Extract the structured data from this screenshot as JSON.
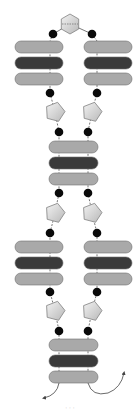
{
  "diagram": {
    "type": "schematic",
    "colors": {
      "light_bar": "#a9a9a9",
      "dark_bar": "#3a3a3a",
      "bar_stroke": "#6e6e6e",
      "bead": "#0a0a0a",
      "connector_fill": "#d4d4d4",
      "connector_stroke": "#808080",
      "chain": "#555555",
      "arrow": "#444444"
    },
    "top_connector": {
      "shape": "hexagon",
      "cx": 70,
      "cy": 24
    },
    "stacks": [
      {
        "id": "upper-left",
        "x": 15,
        "w": 48,
        "rows_y": [
          41,
          57,
          73
        ]
      },
      {
        "id": "upper-right",
        "x": 84,
        "w": 48,
        "rows_y": [
          41,
          57,
          73
        ]
      },
      {
        "id": "middle",
        "x": 49,
        "w": 49,
        "rows_y": [
          141,
          157,
          173
        ]
      },
      {
        "id": "lower-left",
        "x": 15,
        "w": 48,
        "rows_y": [
          241,
          257,
          273
        ]
      },
      {
        "id": "lower-right",
        "x": 84,
        "w": 48,
        "rows_y": [
          241,
          257,
          273
        ]
      },
      {
        "id": "bottom",
        "x": 49,
        "w": 49,
        "rows_y": [
          339,
          355,
          371
        ]
      }
    ],
    "row_pattern": [
      "light",
      "dark",
      "light"
    ],
    "beads": [
      [
        53,
        34
      ],
      [
        92,
        34
      ],
      [
        50,
        93
      ],
      [
        97,
        93
      ],
      [
        59,
        132
      ],
      [
        88,
        132
      ],
      [
        59,
        193
      ],
      [
        88,
        193
      ],
      [
        50,
        233
      ],
      [
        97,
        233
      ],
      [
        50,
        292
      ],
      [
        97,
        292
      ],
      [
        59,
        331
      ],
      [
        88,
        331
      ]
    ],
    "pentagons": [
      [
        55,
        112
      ],
      [
        92,
        112
      ],
      [
        55,
        213
      ],
      [
        92,
        213
      ],
      [
        55,
        311
      ],
      [
        92,
        311
      ]
    ],
    "arrows": [
      {
        "id": "left-exit",
        "direction": "down-left"
      },
      {
        "id": "right-exit",
        "direction": "up-right"
      }
    ],
    "caption": "· · ·"
  }
}
